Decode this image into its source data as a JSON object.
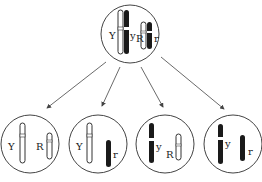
{
  "diagram": {
    "parent_cell": {
      "labels": {
        "y_dominant": "Y",
        "y_recessive": "y",
        "r_dominant": "R",
        "r_recessive": "r"
      }
    },
    "gametes": [
      {
        "label_a": "Y",
        "label_b": "R"
      },
      {
        "label_a": "Y",
        "label_b": "r"
      },
      {
        "label_a": "y",
        "label_b": "R"
      },
      {
        "label_a": "y",
        "label_b": "r"
      }
    ],
    "colors": {
      "line": "#444444",
      "dark": "#1a1a1a",
      "light": "#ffffff"
    }
  }
}
